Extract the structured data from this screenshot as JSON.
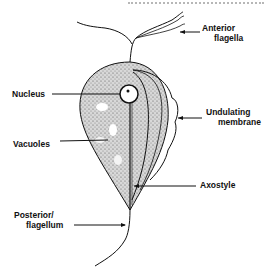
{
  "diagram": {
    "labels": {
      "anterior_flagella": [
        "Anterior",
        "flagella"
      ],
      "nucleus": "Nucleus",
      "undulating_membrane": [
        "Undulating",
        "membrane"
      ],
      "vacuoles": "Vacuoles",
      "axostyle": "Axostyle",
      "posterior_flagellum": [
        "Posterior/",
        "flagellum"
      ]
    },
    "colors": {
      "ink": "#111111",
      "stipple": "#9a9a9a",
      "background": "#ffffff"
    }
  }
}
